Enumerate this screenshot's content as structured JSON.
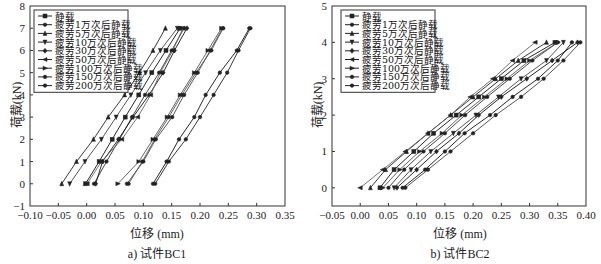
{
  "chart_data": [
    {
      "id": "a",
      "type": "line",
      "title": "",
      "caption": "a) 试件BC1",
      "xlabel": "位移 (mm)",
      "ylabel": "荷载(kN)",
      "xlim": [
        -0.1,
        0.35
      ],
      "ylim": [
        -1,
        8
      ],
      "xticks": [
        "-0.10",
        "-0.05",
        "0.00",
        "0.05",
        "0.10",
        "0.15",
        "0.20",
        "0.25",
        "0.30",
        "0.35"
      ],
      "yticks": [
        "-1",
        "0",
        "1",
        "2",
        "3",
        "4",
        "5",
        "6",
        "7",
        "8"
      ],
      "grid": false,
      "legend_position": "upper left",
      "y": [
        0,
        1,
        2,
        3,
        4,
        5,
        6,
        7
      ],
      "series": [
        {
          "name": "静载",
          "marker": "square",
          "values": [
            -0.002,
            0.022,
            0.045,
            0.068,
            0.092,
            0.115,
            0.14,
            0.165
          ]
        },
        {
          "name": "疲劳1万次后静载",
          "marker": "circle",
          "values": [
            0.013,
            0.035,
            0.058,
            0.08,
            0.103,
            0.128,
            0.15,
            0.172
          ]
        },
        {
          "name": "疲劳5万次后静载",
          "marker": "triangle-up",
          "values": [
            -0.044,
            -0.018,
            0.012,
            0.038,
            0.067,
            0.093,
            0.117,
            0.139
          ]
        },
        {
          "name": "疲劳10万次后静载",
          "marker": "triangle-down",
          "values": [
            -0.03,
            -0.003,
            0.026,
            0.052,
            0.078,
            0.104,
            0.13,
            0.16
          ]
        },
        {
          "name": "疲劳30万次后静载",
          "marker": "diamond",
          "values": [
            0.016,
            0.028,
            0.056,
            0.082,
            0.11,
            0.135,
            0.155,
            0.177
          ]
        },
        {
          "name": "疲劳50万次后静载",
          "marker": "triangle-left",
          "values": [
            0.001,
            0.026,
            0.062,
            0.09,
            0.113,
            0.13,
            0.152,
            0.17
          ]
        },
        {
          "name": "疲劳100万次后静载",
          "marker": "triangle-right",
          "values": [
            0.055,
            0.092,
            0.117,
            0.142,
            0.165,
            0.19,
            0.214,
            0.238
          ]
        },
        {
          "name": "疲劳150万次后静载",
          "marker": "hexagon",
          "values": [
            0.117,
            0.141,
            0.163,
            0.19,
            0.21,
            0.235,
            0.265,
            0.287
          ]
        },
        {
          "name": "疲劳200万次后静载",
          "marker": "star",
          "values": [
            0.071,
            0.1,
            0.122,
            0.151,
            0.172,
            0.196,
            0.218,
            0.24
          ]
        },
        {
          "name": "extra-a",
          "marker": "circle",
          "legend": false,
          "values": [
            0.121,
            0.145,
            0.175,
            0.2,
            0.224,
            0.248,
            0.268,
            0.289
          ]
        },
        {
          "name": "extra-b",
          "marker": "circle",
          "legend": false,
          "values": [
            0.074,
            0.098,
            0.12,
            0.145,
            0.168,
            0.193,
            0.22,
            0.241
          ]
        }
      ]
    },
    {
      "id": "b",
      "type": "line",
      "title": "",
      "caption": "b) 试件BC2",
      "xlabel": "位移 (mm)",
      "ylabel": "荷载(kN)",
      "xlim": [
        -0.05,
        0.4
      ],
      "ylim": [
        -0.5,
        5
      ],
      "xticks": [
        "-0.05",
        "0.00",
        "0.05",
        "0.10",
        "0.15",
        "0.20",
        "0.25",
        "0.30",
        "0.35",
        "0.40"
      ],
      "yticks": [
        "0",
        "1",
        "2",
        "3",
        "4",
        "5"
      ],
      "grid": false,
      "legend_position": "upper left",
      "y": [
        0,
        0.5,
        1,
        1.5,
        2,
        2.5,
        3,
        3.5,
        4
      ],
      "series": [
        {
          "name": "静载",
          "marker": "square",
          "values": [
            0.035,
            0.06,
            0.095,
            0.13,
            0.17,
            0.21,
            0.25,
            0.29,
            0.345
          ]
        },
        {
          "name": "疲劳1万次后静载",
          "marker": "circle",
          "values": [
            0.05,
            0.078,
            0.112,
            0.15,
            0.186,
            0.225,
            0.265,
            0.305,
            0.35
          ]
        },
        {
          "name": "疲劳5万次后静载",
          "marker": "triangle-up",
          "values": [
            0.018,
            0.045,
            0.082,
            0.12,
            0.16,
            0.2,
            0.24,
            0.28,
            0.33
          ]
        },
        {
          "name": "疲劳10万次后静载",
          "marker": "triangle-down",
          "values": [
            0.06,
            0.09,
            0.125,
            0.165,
            0.205,
            0.245,
            0.285,
            0.33,
            0.36
          ]
        },
        {
          "name": "疲劳30万次后静载",
          "marker": "diamond",
          "values": [
            0.065,
            0.1,
            0.135,
            0.175,
            0.21,
            0.25,
            0.295,
            0.34,
            0.385
          ]
        },
        {
          "name": "疲劳50万次后静载",
          "marker": "triangle-left",
          "values": [
            0.0,
            0.04,
            0.08,
            0.12,
            0.16,
            0.195,
            0.235,
            0.27,
            0.31
          ]
        },
        {
          "name": "疲劳100万次后静载",
          "marker": "triangle-right",
          "values": [
            0.04,
            0.07,
            0.105,
            0.145,
            0.18,
            0.22,
            0.26,
            0.3,
            0.35
          ]
        },
        {
          "name": "疲劳150万次后静载",
          "marker": "hexagon",
          "values": [
            0.075,
            0.115,
            0.15,
            0.185,
            0.23,
            0.27,
            0.315,
            0.35,
            0.375
          ]
        },
        {
          "name": "疲劳200万次后静载",
          "marker": "star",
          "values": [
            0.08,
            0.12,
            0.16,
            0.2,
            0.24,
            0.285,
            0.325,
            0.36,
            0.39
          ]
        }
      ]
    }
  ]
}
